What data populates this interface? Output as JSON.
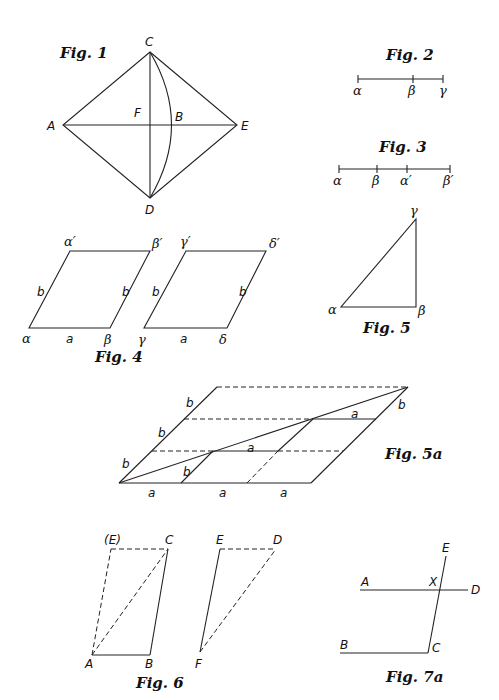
{
  "figures": {
    "fig1": {
      "title": "Fig. 1",
      "points": {
        "C": "C",
        "A": "A",
        "F": "F",
        "B": "B",
        "E": "E",
        "D": "D"
      }
    },
    "fig2": {
      "title": "Fig. 2",
      "points": {
        "alpha": "α",
        "beta": "β",
        "gamma": "γ"
      }
    },
    "fig3": {
      "title": "Fig. 3",
      "points": {
        "alpha": "α",
        "beta": "β",
        "alpha_prime": "α′",
        "beta_prime": "β′"
      }
    },
    "fig4": {
      "title": "Fig. 4",
      "left": {
        "alpha": "α",
        "beta": "β",
        "alpha_prime": "α′",
        "beta_prime": "β′",
        "side_a": "a",
        "side_b_left": "b",
        "side_b_right": "b"
      },
      "right": {
        "gamma": "γ",
        "delta": "δ",
        "gamma_prime": "γ′",
        "delta_prime": "δ′",
        "side_a": "a",
        "side_b_left": "b",
        "side_b_right": "b"
      }
    },
    "fig5": {
      "title": "Fig. 5",
      "points": {
        "alpha": "α",
        "beta": "β",
        "gamma": "γ"
      }
    },
    "fig5a": {
      "title": "Fig. 5a",
      "bottom_labels": [
        "a",
        "a",
        "a"
      ],
      "left_labels": [
        "b",
        "b",
        "b"
      ],
      "inner_labels": {
        "b_inner": "b",
        "a_mid": "a",
        "a_top": "a",
        "b_right": "b"
      }
    },
    "fig6": {
      "title": "Fig. 6",
      "left": {
        "E_paren": "(E)",
        "C": "C",
        "A": "A",
        "B": "B"
      },
      "right": {
        "E": "E",
        "D": "D",
        "F": "F"
      }
    },
    "fig7a": {
      "title": "Fig. 7a",
      "points": {
        "E": "E",
        "A": "A",
        "X": "X",
        "D": "D",
        "B": "B",
        "C": "C"
      }
    }
  }
}
